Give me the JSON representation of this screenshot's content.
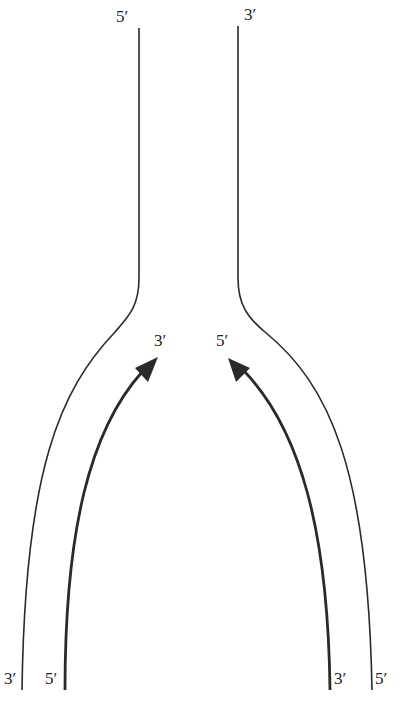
{
  "diagram": {
    "type": "replication-fork",
    "colors": {
      "line": "#2a2a2a",
      "arrow": "#2a2a2a",
      "background": "#ffffff"
    },
    "labels": {
      "top_left": "5′",
      "top_right": "3′",
      "fork_left": "3′",
      "fork_right": "5′",
      "bottom_left_outer": "3′",
      "bottom_left_inner": "5′",
      "bottom_right_inner": "3′",
      "bottom_right_outer": "5′"
    },
    "strands": [
      {
        "id": "parent-left",
        "from": "5′ (top)",
        "to": "3′ (bottom-left)"
      },
      {
        "id": "parent-right",
        "from": "3′ (top)",
        "to": "5′ (bottom-right)"
      },
      {
        "id": "daughter-left",
        "from": "5′ (bottom)",
        "to": "3′ (fork)",
        "arrow": true
      },
      {
        "id": "daughter-right",
        "from": "3′ (bottom)",
        "to": "5′ (fork)",
        "arrow": true
      }
    ]
  }
}
